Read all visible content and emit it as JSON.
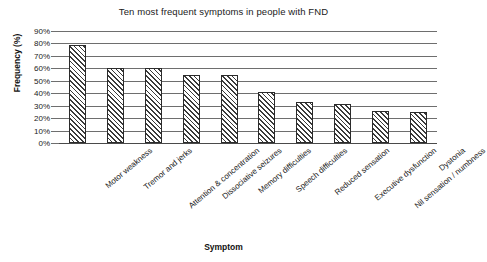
{
  "chart_data": {
    "type": "bar",
    "title": "Ten most frequent symptoms in people with FND",
    "xlabel": "Symptom",
    "ylabel": "Frequency (%)",
    "ylim": [
      0,
      90
    ],
    "ytick_labels": [
      "90%",
      "80%",
      "70%",
      "60%",
      "50%",
      "40%",
      "30%",
      "20%",
      "10%",
      "0%"
    ],
    "ytick_values": [
      90,
      80,
      70,
      60,
      50,
      40,
      30,
      20,
      10,
      0
    ],
    "grid": true,
    "legend": "none",
    "bar_style": "diagonal-hatch",
    "categories": [
      "Motor weakness",
      "Tremor and jerks",
      "Attention & concentration",
      "Dissociative seizures",
      "Memory difficulties",
      "Speech difficulties",
      "Reduced sensation",
      "Executive dysfunction",
      "Nil sensation / numbness",
      "Dystonia"
    ],
    "values": [
      79,
      60,
      60,
      55,
      55,
      41,
      33,
      31,
      26,
      25
    ]
  },
  "colors": {
    "grid": "#6e6e6e",
    "bar_outline": "#2b2b2b",
    "bar_fill": "#ffffff",
    "text": "#1a1a1a",
    "background": "#ffffff"
  }
}
